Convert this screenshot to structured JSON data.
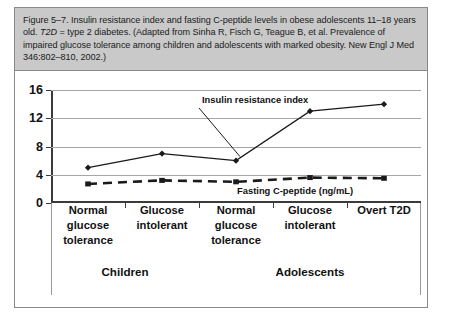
{
  "figure": {
    "caption_parts": {
      "before_italic": "Figure 5–7. Insulin resistance index and fasting C-peptide levels in obese adolescents 11–18 years old. ",
      "italic": "T2D",
      "after_italic": " = type 2 diabetes. (Adapted from Sinha R, Fisch G, Teague B, et al. Prevalence of impaired glucose tolerance among children and adolescents with marked obesity. New Engl J Med 346:802–810, 2002.)"
    },
    "caption_background": "#c9c9c9",
    "border_color": "#8a8a8a"
  },
  "chart_data": {
    "type": "line",
    "title": "",
    "xlabel": "",
    "ylabel": "",
    "ylim": [
      0,
      16
    ],
    "yticks": [
      0,
      4,
      8,
      12,
      16
    ],
    "ytick_labels": [
      "0",
      "4",
      "8",
      "12",
      "16"
    ],
    "grid": true,
    "legend_position": "inline-annotations",
    "categories": [
      "Normal glucose tolerance",
      "Glucose intolerant",
      "Normal glucose tolerance",
      "Glucose intolerant",
      "Overt T2D"
    ],
    "category_lines": [
      [
        "Normal",
        "glucose",
        "tolerance"
      ],
      [
        "Glucose",
        "intolerant"
      ],
      [
        "Normal",
        "glucose",
        "tolerance"
      ],
      [
        "Glucose",
        "intolerant"
      ],
      [
        "Overt T2D"
      ]
    ],
    "groups": [
      {
        "label": "Children",
        "span": 2
      },
      {
        "label": "Adolescents",
        "span": 3
      }
    ],
    "series": [
      {
        "name": "Insulin resistance index",
        "values": [
          5.0,
          7.0,
          6.0,
          13.0,
          14.0
        ],
        "marker": "diamond",
        "line_style": "solid",
        "color": "#1a1a1a"
      },
      {
        "name": "Fasting C-peptide (ng/mL)",
        "values": [
          2.7,
          3.2,
          3.0,
          3.6,
          3.5
        ],
        "marker": "square",
        "line_style": "dashed",
        "color": "#1a1a1a"
      }
    ],
    "annotations": [
      {
        "text": "Insulin resistance index",
        "series": "Insulin resistance index"
      },
      {
        "text": "Fasting C-peptide (ng/mL)",
        "series": "Fasting C-peptide (ng/mL)"
      }
    ]
  }
}
